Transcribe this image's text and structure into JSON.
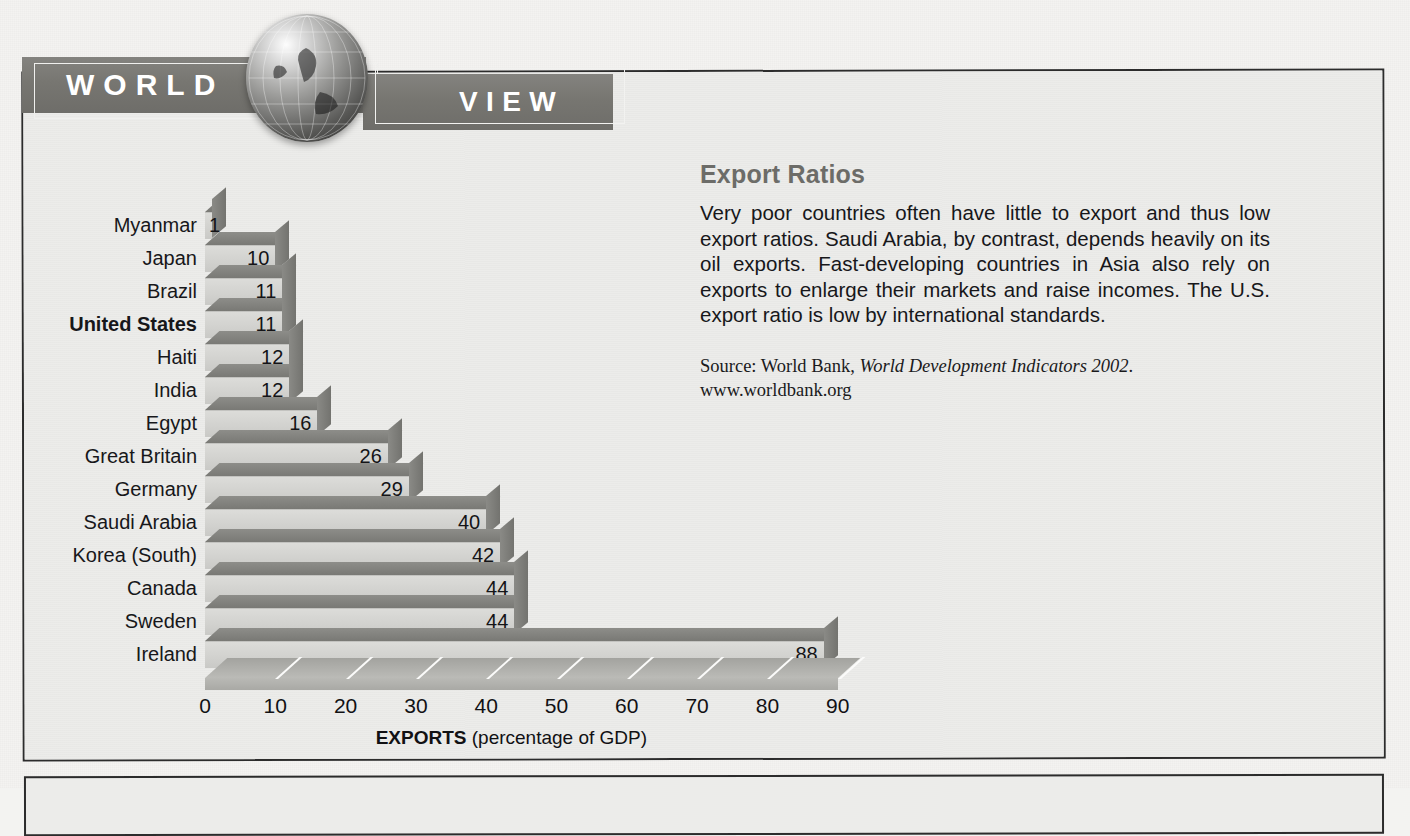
{
  "header": {
    "banner_left": "WORLD",
    "banner_right": "VIEW",
    "globe_icon": "globe-icon"
  },
  "panel": {
    "title": "Export Ratios",
    "body": "Very poor countries often have little to export and thus low export ratios. Saudi Arabia, by contrast, depends heavily on its oil exports. Fast-developing countries in Asia also rely on exports to enlarge their markets and raise incomes. The U.S. export ratio is low by international standards.",
    "source_prefix": "Source: World Bank, ",
    "source_italic": "World Development Indicators 2002",
    "source_suffix": ".",
    "url": "www.worldbank.org"
  },
  "chart_data": {
    "type": "bar",
    "orientation": "horizontal",
    "title": "",
    "xlabel_bold": "EXPORTS",
    "xlabel_rest": " (percentage of GDP)",
    "ylabel": "",
    "xlim": [
      0,
      90
    ],
    "xticks": [
      0,
      10,
      20,
      30,
      40,
      50,
      60,
      70,
      80,
      90
    ],
    "grid": false,
    "legend": false,
    "highlight_category": "United States",
    "categories": [
      "Myanmar",
      "Japan",
      "Brazil",
      "United States",
      "Haiti",
      "India",
      "Egypt",
      "Great Britain",
      "Germany",
      "Saudi Arabia",
      "Korea (South)",
      "Canada",
      "Sweden",
      "Ireland"
    ],
    "values": [
      1,
      10,
      11,
      11,
      12,
      12,
      16,
      26,
      29,
      40,
      42,
      44,
      44,
      88
    ],
    "value_labels": [
      "1",
      "10",
      "11",
      "11",
      "12",
      "12",
      "16",
      "26",
      "29",
      "40",
      "42",
      "44",
      "44",
      "88"
    ]
  },
  "colors": {
    "banner_gray": "#777671",
    "bar_face": "#d2d2cf",
    "bar_shade": "#797975",
    "panel_title": "#6c6c68",
    "text": "#17171a",
    "page_background": "#f4f3f1"
  }
}
